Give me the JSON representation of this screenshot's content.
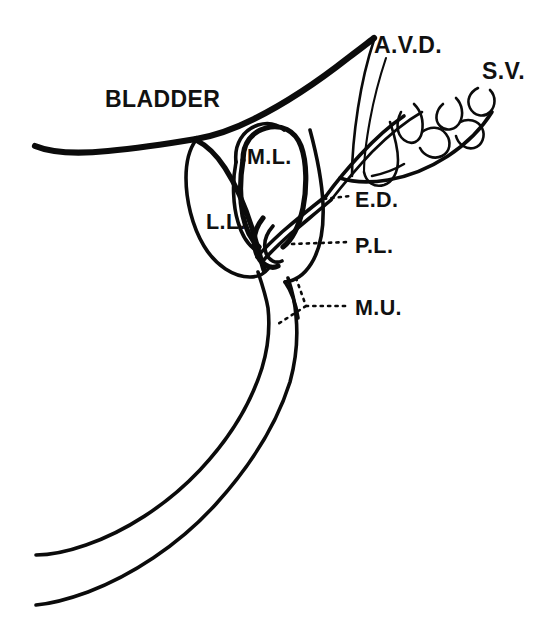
{
  "figure": {
    "background_color": "#ffffff",
    "line_color": "#0b0b0b",
    "width": 552,
    "height": 628
  },
  "labels": {
    "bladder": "BLADDER",
    "ampulla_vas_deferens": "A.V.D.",
    "seminal_vesicle": "S.V.",
    "median_lobe": "M.L.",
    "lateral_lobe": "L.L.",
    "ejaculatory_duct": "E.D.",
    "posterior_lobe": "P.L.",
    "membranous_urethra": "M.U."
  },
  "structures": [
    {
      "name": "bladder-wall",
      "label": "BLADDER"
    },
    {
      "name": "ampulla-of-vas-deferens",
      "label": "A.V.D."
    },
    {
      "name": "seminal-vesicle",
      "label": "S.V."
    },
    {
      "name": "median-lobe",
      "label": "M.L."
    },
    {
      "name": "lateral-lobe",
      "label": "L.L."
    },
    {
      "name": "ejaculatory-duct",
      "label": "E.D."
    },
    {
      "name": "posterior-lobe",
      "label": "P.L."
    },
    {
      "name": "membranous-urethra",
      "label": "M.U."
    }
  ]
}
